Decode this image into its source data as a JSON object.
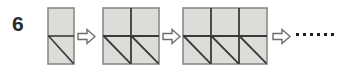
{
  "problem": {
    "number": "6",
    "type": "growing-pattern-sequence",
    "description": "A growing sequence of grey square grids; each stage adds one column, the bottom row squares each contain a diagonal from top-left to bottom-right."
  },
  "colors": {
    "square_fill": "#dcdcd9",
    "grid_line": "#3a3a3a",
    "outer_border": "#8a8a8a",
    "arrow_stroke": "#6e6e6e",
    "arrow_fill": "#ffffff",
    "dot": "#1f1f1f",
    "label_text": "#2b2b2b",
    "background": "#ffffff"
  },
  "stages": [
    {
      "name": "stage-1",
      "columns": 1,
      "rows": 2,
      "cell_size": 26,
      "diagonal_cells": [
        0
      ],
      "square_count": 2,
      "triangle_count": 2
    },
    {
      "name": "stage-2",
      "columns": 2,
      "rows": 2,
      "cell_size": 28,
      "diagonal_cells": [
        0,
        1
      ],
      "square_count": 4,
      "triangle_count": 4
    },
    {
      "name": "stage-3",
      "columns": 3,
      "rows": 2,
      "cell_size": 28,
      "diagonal_cells": [
        0,
        1,
        2
      ],
      "square_count": 6,
      "triangle_count": 6
    }
  ],
  "arrows": [
    {
      "name": "arrow-1",
      "glyph": "right-arrow"
    },
    {
      "name": "arrow-2",
      "glyph": "right-arrow"
    },
    {
      "name": "arrow-3",
      "glyph": "right-arrow"
    }
  ],
  "ellipsis": {
    "dot_count": 6,
    "label": "continues"
  }
}
